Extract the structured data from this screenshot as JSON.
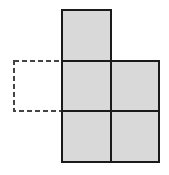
{
  "diagram": {
    "type": "net-of-squares",
    "colors": {
      "fill": "#d9d9d9",
      "stroke": "#1a1a1a",
      "dashed_stroke": "#444444",
      "background": "#ffffff"
    },
    "cells": [
      {
        "id": "top",
        "x": 62,
        "y": 10,
        "w": 49,
        "h": 51,
        "style": "solid"
      },
      {
        "id": "middle-left",
        "x": 62,
        "y": 61,
        "w": 49,
        "h": 50,
        "style": "solid"
      },
      {
        "id": "middle-right",
        "x": 111,
        "y": 61,
        "w": 48,
        "h": 50,
        "style": "solid"
      },
      {
        "id": "bottom-left",
        "x": 62,
        "y": 111,
        "w": 49,
        "h": 51,
        "style": "solid"
      },
      {
        "id": "bottom-right",
        "x": 111,
        "y": 111,
        "w": 48,
        "h": 51,
        "style": "solid"
      }
    ],
    "dashed_cell": {
      "id": "missing-square",
      "x": 14,
      "y": 61,
      "w": 48,
      "h": 50,
      "style": "dashed"
    }
  }
}
